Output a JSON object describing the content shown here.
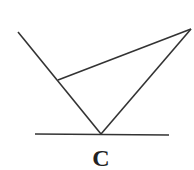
{
  "diagram": {
    "label": "C",
    "stroke_color": "#333333",
    "background": "#ffffff",
    "lines": {
      "left_ray": {
        "x1": 18,
        "y1": 32,
        "x2": 101,
        "y2": 134
      },
      "right_ray": {
        "x1": 191,
        "y1": 29,
        "x2": 101,
        "y2": 134
      },
      "cross_segment": {
        "x1": 58,
        "y1": 80,
        "x2": 191,
        "y2": 29
      },
      "baseline": {
        "x1": 35,
        "y1": 134,
        "x2": 169,
        "y2": 135
      }
    }
  }
}
